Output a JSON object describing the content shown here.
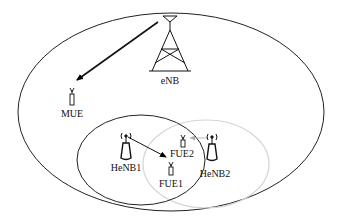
{
  "diagram": {
    "title": "",
    "nodes": {
      "enb": {
        "label": "eNB",
        "type": "macro-base-station"
      },
      "mue": {
        "label": "MUE",
        "type": "macro-user-equipment"
      },
      "henb1": {
        "label": "HeNB1",
        "type": "femto-base-station"
      },
      "henb2": {
        "label": "HeNB2",
        "type": "femto-base-station"
      },
      "fue1": {
        "label": "FUE1",
        "type": "femto-user-equipment"
      },
      "fue2": {
        "label": "FUE2",
        "type": "femto-user-equipment"
      }
    },
    "links": [
      {
        "from": "eNB",
        "to": "MUE",
        "style": "solid-bold"
      },
      {
        "from": "HeNB1",
        "to": "FUE1",
        "style": "solid"
      },
      {
        "from": "HeNB2",
        "to": "FUE2",
        "style": "solid-gray"
      }
    ],
    "regions": [
      {
        "name": "macrocell",
        "color": "#000000"
      },
      {
        "name": "femtocell-1",
        "color": "#000000"
      },
      {
        "name": "femtocell-2",
        "color": "#cfcfcf"
      }
    ]
  }
}
